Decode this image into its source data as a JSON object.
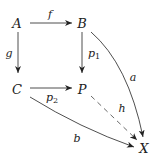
{
  "diagram": {
    "type": "commutative-diagram",
    "nodes": [
      {
        "id": "A",
        "label": "A",
        "x": 17,
        "y": 23
      },
      {
        "id": "B",
        "label": "B",
        "x": 82,
        "y": 23
      },
      {
        "id": "C",
        "label": "C",
        "x": 17,
        "y": 89
      },
      {
        "id": "P",
        "label": "P",
        "x": 82,
        "y": 89
      },
      {
        "id": "X",
        "label": "X",
        "x": 144,
        "y": 148
      }
    ],
    "edges": [
      {
        "from": "A",
        "to": "B",
        "label": "f",
        "style": "solid"
      },
      {
        "from": "A",
        "to": "C",
        "label": "g",
        "style": "solid"
      },
      {
        "from": "B",
        "to": "P",
        "label": "p",
        "label_sub": "1",
        "style": "solid"
      },
      {
        "from": "C",
        "to": "P",
        "label": "p",
        "label_sub": "2",
        "style": "solid"
      },
      {
        "from": "B",
        "to": "X",
        "label": "a",
        "style": "solid",
        "curved": true
      },
      {
        "from": "C",
        "to": "X",
        "label": "b",
        "style": "solid",
        "curved": true
      },
      {
        "from": "P",
        "to": "X",
        "label": "h",
        "style": "dashed"
      }
    ],
    "colors": {
      "stroke": "#222222",
      "background": "#ffffff"
    }
  }
}
